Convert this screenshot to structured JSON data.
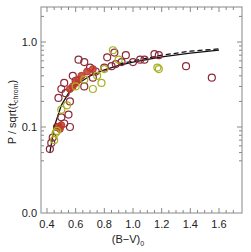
{
  "chart_data": {
    "type": "scatter",
    "title": "",
    "xlabel": "(B-V)_0",
    "xlabel_main": "(B−V)",
    "xlabel_sub": "0",
    "ylabel": "P / sqrt(t_chrom)",
    "ylabel_main": "P / sqrt(t",
    "ylabel_sub": "chrom",
    "ylabel_close": ")",
    "xlim": [
      0.35,
      1.75
    ],
    "ylim_log": [
      0.03,
      2.0
    ],
    "yscale": "log",
    "grid": false,
    "legend": null,
    "x_ticks": [
      "0.4",
      "0.6",
      "0.8",
      "1.0",
      "1.2",
      "1.4",
      "1.6"
    ],
    "y_ticks": [
      "0.0",
      "0.1",
      "1.0"
    ],
    "colors": {
      "frame": "#888888",
      "text": "#222222",
      "curve": "#111111",
      "dark_red": "#8b2a3a",
      "red": "#c0392b",
      "olive": "#a8b020",
      "orange": "#c87530"
    },
    "series": [
      {
        "name": "dark-red circles",
        "marker": "open-circle",
        "color": "#8b2a3a",
        "points": [
          [
            0.42,
            0.055
          ],
          [
            0.43,
            0.065
          ],
          [
            0.44,
            0.075
          ],
          [
            0.47,
            0.1
          ],
          [
            0.52,
            0.11
          ],
          [
            0.56,
            0.1
          ],
          [
            0.5,
            0.13
          ],
          [
            0.55,
            0.14
          ],
          [
            0.48,
            0.22
          ],
          [
            0.5,
            0.28
          ],
          [
            0.53,
            0.25
          ],
          [
            0.56,
            0.2
          ],
          [
            0.52,
            0.33
          ],
          [
            0.6,
            0.35
          ],
          [
            0.66,
            0.3
          ],
          [
            0.58,
            0.4
          ],
          [
            0.62,
            0.62
          ],
          [
            0.66,
            0.58
          ],
          [
            0.72,
            0.38
          ],
          [
            0.74,
            0.45
          ],
          [
            0.8,
            0.5
          ],
          [
            0.85,
            0.52
          ],
          [
            0.88,
            0.55
          ],
          [
            0.92,
            0.58
          ],
          [
            0.95,
            0.7
          ],
          [
            1.0,
            0.58
          ],
          [
            1.05,
            0.62
          ],
          [
            1.08,
            0.62
          ],
          [
            1.15,
            0.72
          ],
          [
            1.18,
            0.7
          ],
          [
            1.37,
            0.52
          ],
          [
            1.55,
            0.38
          ],
          [
            0.82,
            0.66
          ],
          [
            0.87,
            0.75
          ],
          [
            0.7,
            0.5
          ]
        ]
      },
      {
        "name": "red filled cluster",
        "marker": "filled-circle",
        "color": "#c0392b",
        "points": [
          [
            0.48,
            0.1
          ],
          [
            0.49,
            0.095
          ],
          [
            0.5,
            0.105
          ],
          [
            0.56,
            0.28
          ],
          [
            0.58,
            0.3
          ],
          [
            0.6,
            0.33
          ],
          [
            0.62,
            0.36
          ],
          [
            0.64,
            0.4
          ],
          [
            0.68,
            0.45
          ],
          [
            0.72,
            0.48
          ]
        ]
      },
      {
        "name": "olive circles",
        "marker": "open-circle",
        "color": "#a8b020",
        "points": [
          [
            0.45,
            0.07
          ],
          [
            0.46,
            0.085
          ],
          [
            0.47,
            0.09
          ],
          [
            0.5,
            0.16
          ],
          [
            0.54,
            0.18
          ],
          [
            0.6,
            0.3
          ],
          [
            0.66,
            0.36
          ],
          [
            0.75,
            0.4
          ],
          [
            0.8,
            0.48
          ],
          [
            0.86,
            0.8
          ],
          [
            0.9,
            0.62
          ],
          [
            1.17,
            0.5
          ],
          [
            1.18,
            0.48
          ],
          [
            0.78,
            0.33
          ],
          [
            0.72,
            0.28
          ]
        ]
      }
    ],
    "curves": [
      {
        "name": "solid fit",
        "style": "solid",
        "color": "#111111",
        "points": [
          [
            0.42,
            0.05
          ],
          [
            0.45,
            0.1
          ],
          [
            0.5,
            0.18
          ],
          [
            0.55,
            0.25
          ],
          [
            0.6,
            0.31
          ],
          [
            0.7,
            0.4
          ],
          [
            0.8,
            0.47
          ],
          [
            0.9,
            0.53
          ],
          [
            1.0,
            0.58
          ],
          [
            1.2,
            0.67
          ],
          [
            1.4,
            0.74
          ],
          [
            1.6,
            0.8
          ]
        ]
      },
      {
        "name": "dashed fit",
        "style": "dashed",
        "color": "#111111",
        "points": [
          [
            0.9,
            0.55
          ],
          [
            1.0,
            0.6
          ],
          [
            1.2,
            0.7
          ],
          [
            1.4,
            0.78
          ],
          [
            1.6,
            0.83
          ]
        ]
      }
    ]
  }
}
